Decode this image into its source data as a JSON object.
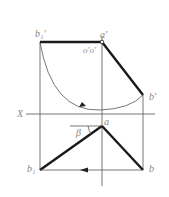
{
  "diagram": {
    "type": "descriptive-geometry-rotation",
    "colors": {
      "thick_line": "#1a1a1a",
      "thin_line": "#555555",
      "label": "#888888",
      "background": "#ffffff"
    },
    "labels": {
      "b1_prime": "b₁'",
      "a_prime": "a'",
      "axis_point": "o'o'",
      "b_prime": "b'",
      "x_axis": "X",
      "a": "a",
      "beta": "β",
      "b1": "b₁",
      "b": "b"
    }
  }
}
